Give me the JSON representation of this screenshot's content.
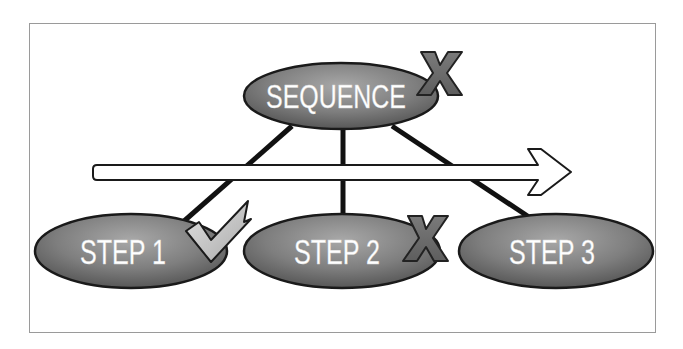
{
  "diagram": {
    "type": "hierarchy-sequence",
    "root": {
      "label": "SEQUENCE",
      "mark": "x-mark"
    },
    "steps": [
      {
        "label": "STEP 1",
        "mark": "check-mark"
      },
      {
        "label": "STEP 2",
        "mark": "x-mark"
      },
      {
        "label": "STEP 3",
        "mark": "none"
      }
    ],
    "arrow": {
      "direction": "right",
      "meaning": "timeline / order"
    },
    "colors": {
      "node_fill_light": "#a0a0a0",
      "node_fill_dark": "#5c5c5c",
      "node_stroke": "#1a1a1a",
      "text": "#ffffff",
      "x_mark_fill": "#6e6e6e",
      "check_fill": "#c8c8c8",
      "connector": "#111111",
      "frame": "#9a9a9a"
    }
  }
}
